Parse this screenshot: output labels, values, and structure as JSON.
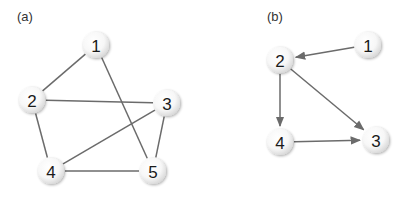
{
  "figure": {
    "panels": [
      {
        "id": "a",
        "label": "(a)",
        "label_pos": [
          17,
          21
        ],
        "directed": false,
        "nodes": [
          {
            "id": "1",
            "label": "1",
            "x": 96,
            "y": 45
          },
          {
            "id": "2",
            "label": "2",
            "x": 32,
            "y": 100
          },
          {
            "id": "3",
            "label": "3",
            "x": 167,
            "y": 103
          },
          {
            "id": "4",
            "label": "4",
            "x": 51,
            "y": 171
          },
          {
            "id": "5",
            "label": "5",
            "x": 153,
            "y": 171
          }
        ],
        "edges": [
          {
            "from": "1",
            "to": "2"
          },
          {
            "from": "1",
            "to": "5"
          },
          {
            "from": "2",
            "to": "3"
          },
          {
            "from": "2",
            "to": "4"
          },
          {
            "from": "3",
            "to": "4"
          },
          {
            "from": "3",
            "to": "5"
          },
          {
            "from": "4",
            "to": "5"
          }
        ]
      },
      {
        "id": "b",
        "label": "(b)",
        "label_pos": [
          267,
          21
        ],
        "directed": true,
        "nodes": [
          {
            "id": "1",
            "label": "1",
            "x": 368,
            "y": 45
          },
          {
            "id": "2",
            "label": "2",
            "x": 280,
            "y": 60
          },
          {
            "id": "3",
            "label": "3",
            "x": 376,
            "y": 140
          },
          {
            "id": "4",
            "label": "4",
            "x": 280,
            "y": 142
          }
        ],
        "edges": [
          {
            "from": "1",
            "to": "2"
          },
          {
            "from": "2",
            "to": "4"
          },
          {
            "from": "2",
            "to": "3"
          },
          {
            "from": "4",
            "to": "3"
          }
        ]
      }
    ],
    "colors": {
      "edge": "#6b6b6b",
      "node_fill": "#ffffff",
      "node_shade": "#d9d9d9",
      "label_text": "#1a1a1a"
    },
    "node_radius": 13
  }
}
